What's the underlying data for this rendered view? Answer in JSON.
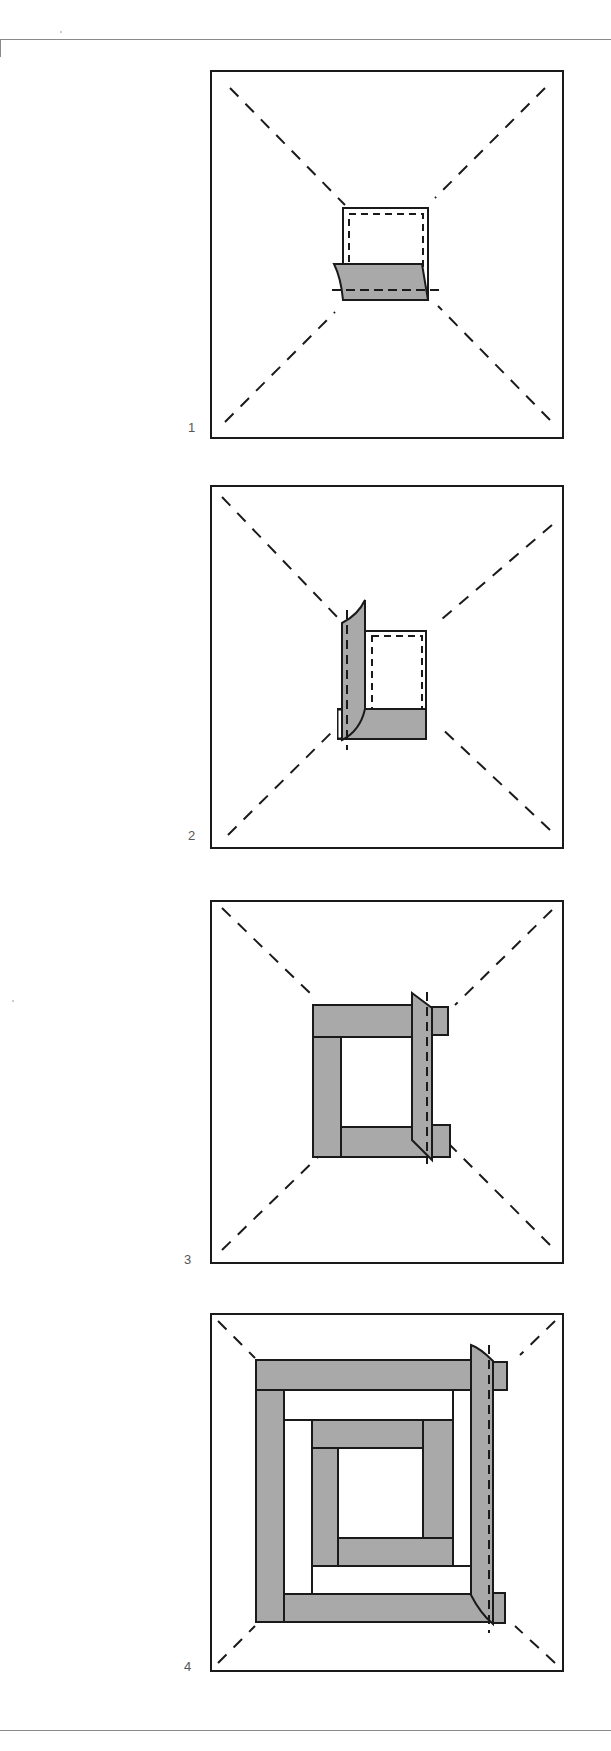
{
  "figure": {
    "colors": {
      "outline": "#1a1a1a",
      "fabric_fill": "#a9a9a9",
      "background": "#ffffff",
      "label": "#555555"
    }
  },
  "steps": [
    {
      "number": "1",
      "caption": "Center square with first strip folded along bottom seam"
    },
    {
      "number": "2",
      "caption": "Second strip folded along left seam"
    },
    {
      "number": "3",
      "caption": "Third strip folded along right seam"
    },
    {
      "number": "4",
      "caption": "Multiple rounds of strips; next strip folded along right seam"
    }
  ]
}
